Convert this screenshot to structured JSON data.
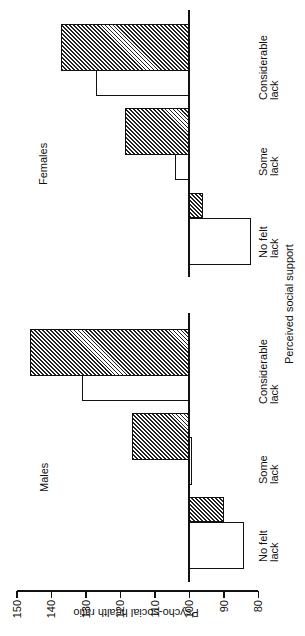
{
  "chart_data": {
    "type": "bar",
    "orientation": "rotated 90 degrees counter-clockwise (bars extend horizontally in screenshot)",
    "ylabel": "Psycho-social health ratio",
    "xlabel": "Perceived social support",
    "ylim": [
      80,
      150
    ],
    "yticks": [
      80,
      90,
      100,
      110,
      120,
      130,
      140,
      150
    ],
    "baseline": 100,
    "grid": false,
    "legend": null,
    "categories": [
      "No felt lack",
      "Some lack",
      "Considerable lack"
    ],
    "panels": [
      {
        "title": "Males",
        "series": [
          {
            "name": "open",
            "fill": "white",
            "values": [
              84,
              99,
              131
            ]
          },
          {
            "name": "hatched",
            "fill": "hatched",
            "values": [
              90,
              116.5,
              146
            ]
          }
        ]
      },
      {
        "title": "Females",
        "series": [
          {
            "name": "open",
            "fill": "white",
            "values": [
              82,
              104,
              127
            ]
          },
          {
            "name": "hatched",
            "fill": "hatched",
            "values": [
              96,
              118.5,
              137
            ]
          }
        ]
      }
    ]
  },
  "labels": {
    "yaxis_title": "Psycho-social health ratio",
    "xaxis_title": "Perceived social support",
    "ticks": [
      "80",
      "90",
      "100",
      "110",
      "120",
      "130",
      "140",
      "150"
    ],
    "males": "Males",
    "females": "Females",
    "cat_no_felt_1": "No felt",
    "cat_no_felt_2": "lack",
    "cat_some_1": "Some",
    "cat_some_2": "lack",
    "cat_considerable_1": "Considerable",
    "cat_considerable_2": "lack"
  },
  "colors": {
    "ink": "#111111",
    "background": "#ffffff"
  }
}
